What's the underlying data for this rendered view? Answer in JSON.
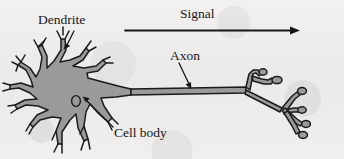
{
  "figure": {
    "background_color": "#efeeec",
    "ink_color": "#17161a",
    "cell_fill_color": "#9a9a9a"
  },
  "labels": {
    "dendrite": "Dendrite",
    "signal": "Signal",
    "axon": "Axon",
    "cell_body": "Cell body"
  },
  "diagram_data": {
    "type": "labeled-illustration",
    "subject": "neuron",
    "parts": [
      {
        "name": "dendrite",
        "label": "Dendrite",
        "label_position": [
          38,
          13
        ],
        "leader_line": {
          "from": [
            72,
            31
          ],
          "to": [
            66,
            48
          ],
          "arrowhead": "filled-triangle"
        },
        "description": "branched tapering projections radiating from the cell body, each forking into Y-shaped tips"
      },
      {
        "name": "cell-body",
        "label": "Cell body",
        "label_position": [
          114,
          126
        ],
        "leader_line": {
          "from": [
            112,
            128
          ],
          "to": [
            83,
            98
          ],
          "arrowhead": "filled-triangle"
        },
        "description": "gray filled soma polygon containing a small open-outline nucleus ellipse"
      },
      {
        "name": "axon",
        "label": "Axon",
        "label_position": [
          170,
          49
        ],
        "leader_line": {
          "from": [
            180,
            64
          ],
          "to": [
            190,
            88
          ],
          "arrowhead": "filled-triangle"
        },
        "description": "long thin gray shaft extending right from the soma to the terminal branches"
      },
      {
        "name": "signal-arrow",
        "label": "Signal",
        "label_position": [
          180,
          7
        ],
        "arrow": {
          "from": [
            125,
            30
          ],
          "to": [
            296,
            30
          ],
          "direction": "left-to-right",
          "arrowhead": "filled-triangle"
        },
        "description": "horizontal arrow above the neuron indicating direction of signal propagation"
      },
      {
        "name": "axon-terminals",
        "label": "",
        "description": "terminal branches ending in bulbous synaptic knobs at the right end of the axon"
      },
      {
        "name": "nucleus",
        "label": "",
        "description": "small unfilled ellipse outline inside the cell body"
      }
    ]
  }
}
